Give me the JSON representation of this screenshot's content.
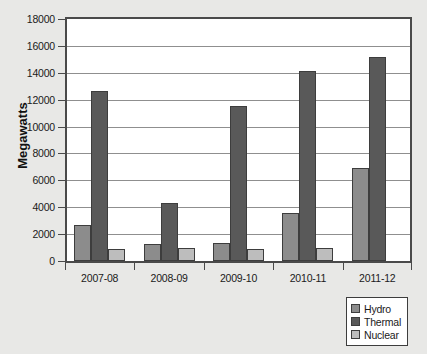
{
  "chart_data": {
    "type": "bar",
    "title": "",
    "xlabel": "",
    "ylabel": "Megawatts",
    "ylim": [
      0,
      18000
    ],
    "ytick_step": 2000,
    "yticks": [
      0,
      2000,
      4000,
      6000,
      8000,
      10000,
      12000,
      14000,
      16000,
      18000
    ],
    "ytick_labels": [
      "0",
      "2000",
      "4000",
      "6000",
      "8000",
      "10000",
      "12000",
      "14000",
      "16000",
      "18000"
    ],
    "grid": true,
    "grid_axis": "y",
    "legend_position": "bottom-right",
    "categories": [
      "2007-08",
      "2008-09",
      "2009-10",
      "2010-11",
      "2011-12"
    ],
    "series": [
      {
        "name": "Hydro",
        "color": "#8c8c8c",
        "values": [
          2700,
          1250,
          1350,
          3600,
          6900
        ]
      },
      {
        "name": "Thermal",
        "color": "#595959",
        "values": [
          12650,
          4350,
          11500,
          14150,
          15200
        ]
      },
      {
        "name": "Nuclear",
        "color": "#bdbdbd",
        "values": [
          880,
          950,
          900,
          1000,
          0
        ]
      }
    ]
  },
  "legend": {
    "items": [
      {
        "label": "Hydro"
      },
      {
        "label": "Thermal"
      },
      {
        "label": "Nuclear"
      }
    ]
  },
  "colors": {
    "page_background": "#e8e8e6",
    "plot_background": "#ffffff",
    "axis": "#4a4a4a",
    "gridline": "#8f8f8f",
    "bar_outline": "#3d3d3d",
    "hydro": "#8c8c8c",
    "thermal": "#595959",
    "nuclear": "#bdbdbd",
    "text": "#1a1a1a"
  }
}
